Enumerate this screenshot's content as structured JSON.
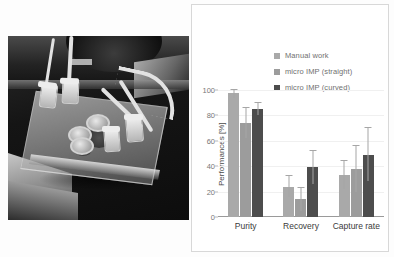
{
  "figure": {
    "photo": {
      "alt_name": "microfluidic-chip-device-photo",
      "caption": ""
    }
  },
  "chart_data": {
    "type": "bar",
    "title": "",
    "xlabel": "",
    "ylabel": "Performances [%]",
    "ylim": [
      0,
      100
    ],
    "yticks": [
      0,
      20,
      40,
      60,
      80,
      100
    ],
    "ytick_labels": [
      "0",
      "20",
      "40",
      "60",
      "80",
      "100"
    ],
    "grid": true,
    "legend_position": "top-right",
    "categories": [
      "Purity",
      "Recovery",
      "Capture rate"
    ],
    "series": [
      {
        "name": "Manual work",
        "color": "#a9a9a9",
        "values": [
          98,
          24,
          33
        ],
        "errors": [
          4,
          8,
          11
        ]
      },
      {
        "name": "micro IMP (straight)",
        "color": "#9c9c9c",
        "values": [
          74,
          14,
          38
        ],
        "errors": [
          12,
          9,
          18
        ]
      },
      {
        "name": "micro IMP (curved)",
        "color": "#4d4d4d",
        "values": [
          85,
          39,
          49
        ],
        "errors": [
          5,
          13,
          21
        ]
      }
    ]
  }
}
